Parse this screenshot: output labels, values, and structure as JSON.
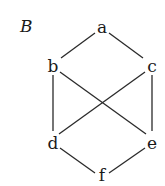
{
  "diagram": {
    "title": "B",
    "type": "hasse-diagram",
    "nodes": [
      {
        "id": "a",
        "label": "a",
        "x": 102,
        "y": 28
      },
      {
        "id": "b",
        "label": "b",
        "x": 53,
        "y": 66
      },
      {
        "id": "c",
        "label": "c",
        "x": 151,
        "y": 66
      },
      {
        "id": "d",
        "label": "d",
        "x": 53,
        "y": 143
      },
      {
        "id": "e",
        "label": "e",
        "x": 151,
        "y": 143
      },
      {
        "id": "f",
        "label": "f",
        "x": 102,
        "y": 176
      }
    ],
    "edges": [
      [
        "a",
        "b"
      ],
      [
        "a",
        "c"
      ],
      [
        "b",
        "d"
      ],
      [
        "b",
        "e"
      ],
      [
        "c",
        "d"
      ],
      [
        "c",
        "e"
      ],
      [
        "d",
        "f"
      ],
      [
        "e",
        "f"
      ]
    ]
  }
}
